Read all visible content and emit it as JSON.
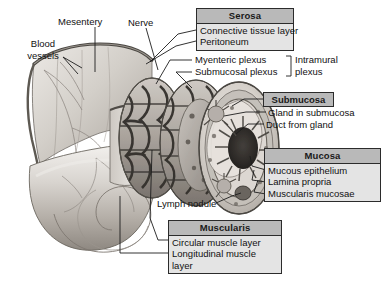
{
  "figure": {
    "type": "anatomical-diagram"
  },
  "left_labels": {
    "blood_vessels": "Blood\nvessels",
    "blood_vessels_line1": "Blood",
    "blood_vessels_line2": "vessels",
    "mesentery": "Mesentery",
    "nerve": "Nerve"
  },
  "serosa": {
    "heading": "Serosa",
    "items": [
      "Connective tissue layer",
      "Peritoneum"
    ]
  },
  "plexus": {
    "items": [
      "Myenteric plexus",
      "Submucosal plexus"
    ],
    "bracket_label_line1": "Intramural",
    "bracket_label_line2": "plexus"
  },
  "submucosa": {
    "heading": "Submucosa",
    "items": [
      "Gland in submucosa",
      "Duct from gland"
    ]
  },
  "mucosa": {
    "heading": "Mucosa",
    "items": [
      "Mucous epithelium",
      "Lamina propria",
      "Muscularis mucosae"
    ]
  },
  "lymph_nodule": {
    "label": "Lymph nodule"
  },
  "muscularis": {
    "heading": "Muscularis",
    "items": [
      "Circular muscle layer",
      "Longitudinal muscle",
      "layer"
    ]
  },
  "colors": {
    "box_border": "#2b2b2b",
    "box_header_fill": "#b9b9b9",
    "box_body_fill": "#e4e4e4",
    "text": "#111111",
    "leader_line": "#1d1d1d",
    "tissue_light": "#dcd8d2",
    "tissue_mid": "#b2ada6",
    "tissue_dark": "#6f6a64",
    "plexus_dark": "#3a3733"
  }
}
